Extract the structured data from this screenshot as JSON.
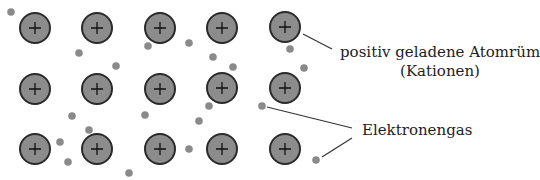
{
  "diagram": {
    "colors": {
      "ion_fill": "#8c8c8c",
      "ion_stroke": "#2a2a2a",
      "electron_fill": "#8a8a8a",
      "line": "#333333"
    },
    "ion_symbol": "+",
    "ions": [
      {
        "x": 35,
        "y": 28
      },
      {
        "x": 97,
        "y": 28
      },
      {
        "x": 160,
        "y": 28
      },
      {
        "x": 222,
        "y": 28
      },
      {
        "x": 285,
        "y": 27
      },
      {
        "x": 35,
        "y": 89
      },
      {
        "x": 97,
        "y": 89
      },
      {
        "x": 160,
        "y": 89
      },
      {
        "x": 222,
        "y": 88
      },
      {
        "x": 285,
        "y": 88
      },
      {
        "x": 35,
        "y": 149
      },
      {
        "x": 97,
        "y": 149
      },
      {
        "x": 160,
        "y": 149
      },
      {
        "x": 222,
        "y": 149
      },
      {
        "x": 285,
        "y": 149
      }
    ],
    "electrons": [
      {
        "x": 11,
        "y": 12
      },
      {
        "x": 79,
        "y": 53
      },
      {
        "x": 116,
        "y": 66
      },
      {
        "x": 148,
        "y": 46
      },
      {
        "x": 189,
        "y": 43
      },
      {
        "x": 213,
        "y": 57
      },
      {
        "x": 233,
        "y": 67
      },
      {
        "x": 290,
        "y": 49
      },
      {
        "x": 304,
        "y": 68
      },
      {
        "x": 72,
        "y": 116
      },
      {
        "x": 89,
        "y": 130
      },
      {
        "x": 60,
        "y": 142
      },
      {
        "x": 68,
        "y": 162
      },
      {
        "x": 145,
        "y": 115
      },
      {
        "x": 209,
        "y": 106
      },
      {
        "x": 199,
        "y": 121
      },
      {
        "x": 262,
        "y": 106
      },
      {
        "x": 129,
        "y": 173
      },
      {
        "x": 189,
        "y": 149
      },
      {
        "x": 316,
        "y": 160
      }
    ],
    "leader_lines": [
      {
        "x1": 303,
        "y1": 34,
        "x2": 332,
        "y2": 49
      },
      {
        "x1": 267,
        "y1": 107,
        "x2": 352,
        "y2": 128
      },
      {
        "x1": 322,
        "y1": 157,
        "x2": 352,
        "y2": 138
      }
    ],
    "labels": {
      "ion_line1": "positiv geladene Atomrümpfe",
      "ion_line2": "(Kationen)",
      "electron_gas": "Elektronengas"
    }
  }
}
